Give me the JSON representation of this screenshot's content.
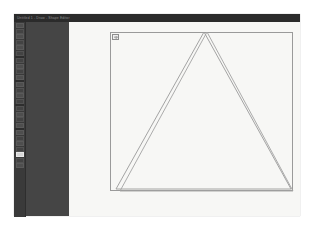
{
  "window": {
    "title": "Untitled 1 - Draw - Shape Editor",
    "title_bar_color": "#2b2b2b",
    "panel_color": "#454545",
    "canvas_color": "#f7f7f5"
  },
  "tool_panel": {
    "name": "tools-panel",
    "tools": [
      {
        "name": "select-icon",
        "kind": "icon"
      },
      {
        "name": "node-edit-icon",
        "kind": "icon"
      },
      {
        "name": "rectangle-icon",
        "kind": "icon"
      },
      {
        "name": "ellipse-icon",
        "kind": "icon"
      },
      {
        "name": "star-icon",
        "kind": "icon"
      },
      {
        "name": "spiral-icon",
        "kind": "icon"
      },
      {
        "name": "separator-1",
        "kind": "sep"
      },
      {
        "name": "pencil-icon",
        "kind": "icon"
      },
      {
        "name": "bezier-pen-icon",
        "kind": "icon"
      },
      {
        "name": "calligraphy-icon",
        "kind": "icon"
      },
      {
        "name": "text-icon",
        "kind": "icon"
      },
      {
        "name": "separator-2",
        "kind": "sep"
      },
      {
        "name": "gradient-icon",
        "kind": "icon"
      },
      {
        "name": "mesh-icon",
        "kind": "icon"
      },
      {
        "name": "dropper-icon",
        "kind": "icon"
      },
      {
        "name": "paint-bucket-icon",
        "kind": "icon"
      },
      {
        "name": "separator-3",
        "kind": "sep"
      },
      {
        "name": "tweak-icon",
        "kind": "icon"
      },
      {
        "name": "zoom-icon",
        "kind": "icon"
      },
      {
        "name": "measure-icon",
        "kind": "icon"
      },
      {
        "name": "connector-icon",
        "kind": "icon"
      },
      {
        "name": "separator-4",
        "kind": "sep"
      },
      {
        "name": "3dbox-icon",
        "kind": "icon"
      },
      {
        "name": "eraser-icon",
        "kind": "icon"
      },
      {
        "name": "spray-icon",
        "kind": "icon"
      },
      {
        "name": "clone-icon",
        "kind": "icon"
      },
      {
        "name": "triangle-tool-icon",
        "kind": "active"
      },
      {
        "name": "page-tool-icon",
        "kind": "icon"
      },
      {
        "name": "layers-icon",
        "kind": "icon"
      }
    ]
  },
  "canvas": {
    "name": "drawing-canvas",
    "frame": {
      "name": "drawing-frame-rectangle",
      "stroke": "#9a9a9a",
      "x": 0,
      "y": 0,
      "width": 183,
      "height": 159
    },
    "shapes": [
      {
        "name": "outer-triangle",
        "type": "polygon",
        "stroke": "#9a9a9a",
        "fill": "none",
        "points": "94,0 181,157 6,157"
      },
      {
        "name": "inner-triangle",
        "type": "polygon",
        "stroke": "#a3a3a3",
        "fill": "none",
        "points": "97,0 183,159 10,159"
      }
    ],
    "corner_marker": {
      "name": "selection-corner-marker"
    }
  }
}
